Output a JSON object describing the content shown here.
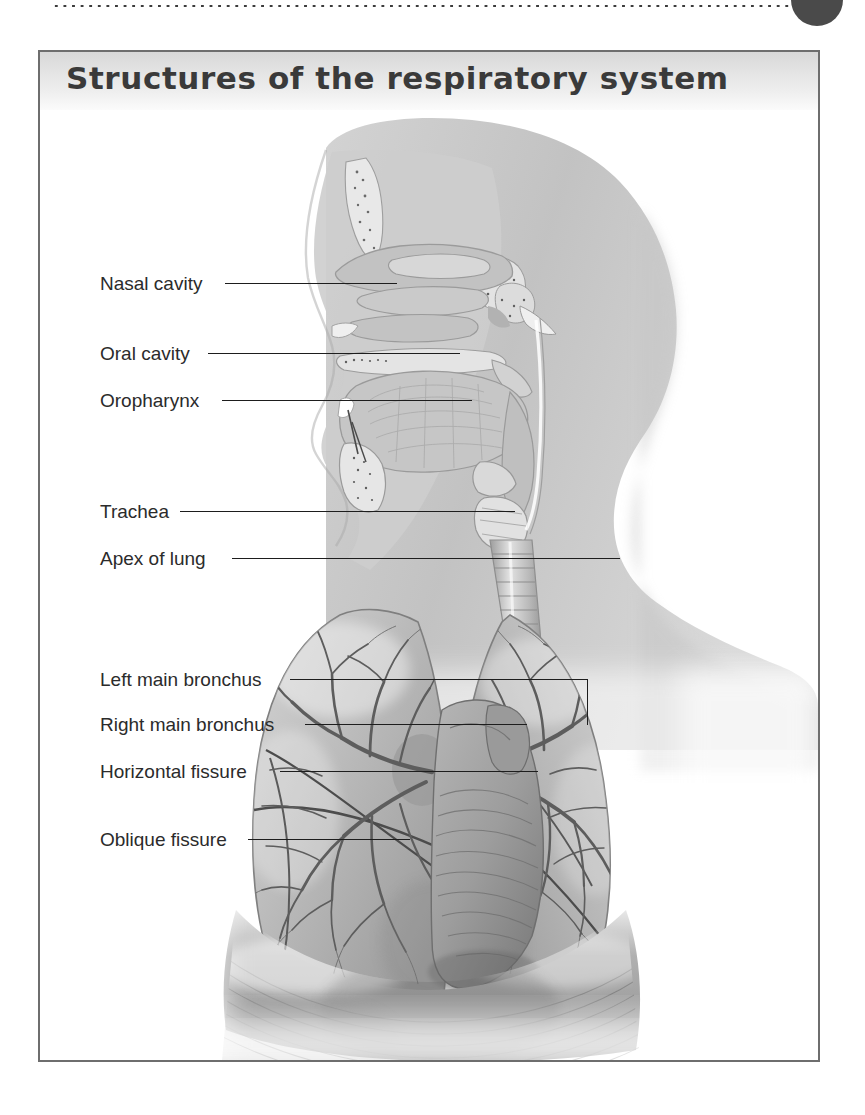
{
  "page": {
    "rule": "dotted-rule",
    "marker": "page-number-circle"
  },
  "figure": {
    "title": "Structures of the respiratory system",
    "frame_color": "#6e6e6e",
    "title_band_color": "#e4e4e4",
    "label_color": "#2b2b2b",
    "leader_color": "#1d1d1d"
  },
  "labels": [
    {
      "id": "nasal-cavity",
      "text": "Nasal cavity",
      "x": 60,
      "y": 222,
      "leader_x": 185,
      "leader_w": 157,
      "leader_y": 231
    },
    {
      "id": "oral-cavity",
      "text": "Oral cavity",
      "x": 60,
      "y": 292,
      "leader_x": 168,
      "leader_w": 252,
      "leader_y": 301
    },
    {
      "id": "oropharynx",
      "text": "Oropharynx",
      "x": 60,
      "y": 339,
      "leader_x": 182,
      "leader_w": 240,
      "leader_y": 348
    },
    {
      "id": "trachea",
      "text": "Trachea",
      "x": 60,
      "y": 450,
      "leader_x": 140,
      "leader_w": 370,
      "leader_y": 459
    },
    {
      "id": "apex-of-lung",
      "text": "Apex of lung",
      "x": 60,
      "y": 497,
      "leader_x": 192,
      "leader_w": 424,
      "leader_y": 506
    },
    {
      "id": "left-main-bronchus",
      "text": "Left main bronchus",
      "x": 60,
      "y": 618,
      "leader_x": 250,
      "leader_w": 333,
      "leader_y": 627
    },
    {
      "id": "right-main-bronchus",
      "text": "Right main bronchus",
      "x": 60,
      "y": 663,
      "leader_x": 265,
      "leader_w": 255,
      "leader_y": 672
    },
    {
      "id": "horizontal-fissure",
      "text": "Horizontal fissure",
      "x": 60,
      "y": 710,
      "leader_x": 240,
      "leader_w": 290,
      "leader_y": 719
    },
    {
      "id": "oblique-fissure",
      "text": "Oblique fissure",
      "x": 60,
      "y": 778,
      "leader_x": 208,
      "leader_w": 200,
      "leader_y": 787
    }
  ],
  "illustration": {
    "subject": "sagittal-head-and-anterior-thorax",
    "parts": [
      "head-neck-silhouette",
      "nasal-cavity-section",
      "oral-cavity-section",
      "oropharynx",
      "larynx",
      "trachea",
      "right-lung",
      "left-lung",
      "bronchial-tree",
      "heart-mediastinum",
      "diaphragm"
    ],
    "palette": {
      "body": "#b9b9b9",
      "tissue": "#c9c9c9",
      "lung": "#bcbcbc",
      "lung_shadow": "#8d8d8d",
      "bronchi": "#6f6f6f",
      "diaphragm": "#9a9a9a",
      "outline": "#7a7a7a"
    }
  }
}
